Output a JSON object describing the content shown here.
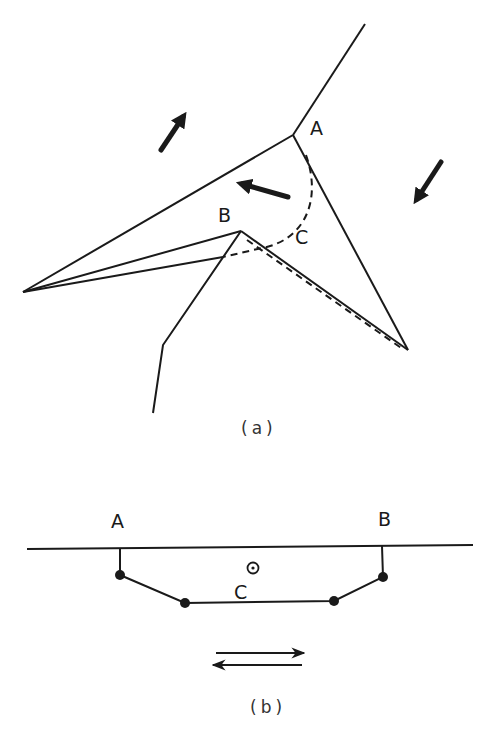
{
  "figure_a": {
    "caption": "(a)",
    "labels": {
      "A": "A",
      "B": "B",
      "C": "C"
    },
    "solid_lines": [
      {
        "name": "upper-ray",
        "points": [
          [
            365,
            24
          ],
          [
            293,
            135
          ]
        ]
      },
      {
        "name": "upper-left-edge",
        "points": [
          [
            293,
            135
          ],
          [
            23,
            292
          ]
        ]
      },
      {
        "name": "right-edge",
        "points": [
          [
            293,
            135
          ],
          [
            408,
            350
          ]
        ]
      },
      {
        "name": "b-upper-edge",
        "points": [
          [
            23,
            292
          ],
          [
            241,
            231
          ]
        ]
      },
      {
        "name": "b-lower-edge",
        "points": [
          [
            23,
            292
          ],
          [
            223,
            257
          ]
        ]
      },
      {
        "name": "b-to-right-tip",
        "points": [
          [
            241,
            231
          ],
          [
            408,
            350
          ]
        ]
      },
      {
        "name": "lower-ray",
        "points": [
          [
            241,
            231
          ],
          [
            163,
            345
          ],
          [
            153,
            413
          ]
        ]
      }
    ],
    "dashed_lines": [
      {
        "name": "arc-c",
        "path": "M306,155 C322,200 305,240 262,248 L223,257"
      },
      {
        "name": "dashed-parallel",
        "path": "M245,238 L404,350"
      }
    ],
    "arrows": [
      {
        "name": "arrow-up-right",
        "from": [
          161,
          150
        ],
        "to": [
          187,
          111
        ]
      },
      {
        "name": "arrow-left",
        "from": [
          288,
          197
        ],
        "to": [
          236,
          182
        ]
      },
      {
        "name": "arrow-down-left",
        "from": [
          441,
          162
        ],
        "to": [
          413,
          205
        ]
      }
    ]
  },
  "figure_b": {
    "caption": "(b)",
    "labels": {
      "A": "A",
      "B": "B",
      "C": "C"
    },
    "baseline": [
      [
        27,
        549
      ],
      [
        473,
        545
      ]
    ],
    "chain": [
      [
        120,
        548
      ],
      [
        120,
        575
      ],
      [
        185,
        603
      ],
      [
        334,
        601
      ],
      [
        383,
        577
      ],
      [
        382,
        546
      ]
    ],
    "nodes": [
      [
        120,
        575
      ],
      [
        185,
        603
      ],
      [
        334,
        601
      ],
      [
        383,
        577
      ]
    ],
    "out_of_plane_symbol": "⊙",
    "double_arrow": {
      "right": {
        "from": [
          216,
          653
        ],
        "to": [
          304,
          653
        ]
      },
      "left": {
        "from": [
          302,
          665
        ],
        "to": [
          213,
          665
        ]
      }
    }
  }
}
